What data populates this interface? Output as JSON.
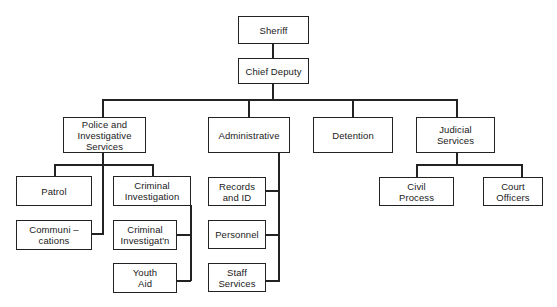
{
  "chart": {
    "title": "",
    "nodes": {
      "sheriff": "Sheriff",
      "chief_deputy": "Chief Deputy",
      "police": "Police and\nInvestigative\nServices",
      "administrative": "Administrative",
      "detention": "Detention",
      "judicial": "Judicial\nServices",
      "patrol": "Patrol",
      "criminal_investigation": "Criminal\nInvestigation",
      "communications": "Communi –\ncations",
      "criminal_investigatn": "Criminal\nInvestigat'n",
      "youth_aid": "Youth\nAid",
      "records": "Records\nand ID",
      "personnel": "Personnel",
      "staff_services": "Staff\nServices",
      "civil_process": "Civil\nProcess",
      "court_officers": "Court\nOfficers"
    },
    "hierarchy": {
      "Sheriff": [
        "Chief Deputy"
      ],
      "Chief Deputy": [
        "Police and Investigative Services",
        "Administrative",
        "Detention",
        "Judicial Services"
      ],
      "Police and Investigative Services": [
        "Patrol",
        "Criminal Investigation",
        "Communications"
      ],
      "Criminal Investigation": [
        "Criminal Investigat'n",
        "Youth Aid"
      ],
      "Administrative": [
        "Records and ID",
        "Personnel",
        "Staff Services"
      ],
      "Detention": [],
      "Judicial Services": [
        "Civil Process",
        "Court Officers"
      ]
    }
  }
}
